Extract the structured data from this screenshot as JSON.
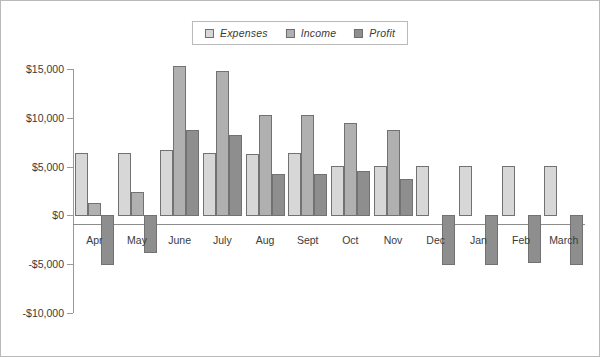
{
  "chart_data": {
    "type": "bar",
    "title": "",
    "xlabel": "",
    "ylabel": "",
    "categories": [
      "Apr",
      "May",
      "June",
      "July",
      "Aug",
      "Sept",
      "Oct",
      "Nov",
      "Dec",
      "Jan",
      "Feb",
      "March"
    ],
    "series": [
      {
        "name": "Expenses",
        "color": "#d7d7d7",
        "values": [
          6350,
          6350,
          6700,
          6350,
          6300,
          6350,
          5100,
          5100,
          5100,
          5100,
          5100,
          5100
        ]
      },
      {
        "name": "Income",
        "color": "#b0b0b0",
        "values": [
          1300,
          2400,
          15350,
          14800,
          10300,
          10300,
          9500,
          8800,
          0,
          0,
          0,
          0
        ]
      },
      {
        "name": "Profit",
        "color": "#8e8e8e",
        "values": [
          -4950,
          -3750,
          8800,
          8200,
          4200,
          4200,
          4500,
          3700,
          -4950,
          -4950,
          -4800,
          -5000
        ]
      }
    ],
    "ylim": [
      -10000,
      15000
    ],
    "yticks": [
      15000,
      10000,
      5000,
      0,
      -5000,
      -10000
    ],
    "ytick_labels": [
      "$15,000",
      "$10,000",
      "$5,000",
      "$0",
      "-$5,000",
      "-$10,000"
    ],
    "grid": false,
    "legend_position": "top-center",
    "legend": [
      "Expenses",
      "Income",
      "Profit"
    ]
  },
  "legend": {
    "items": [
      {
        "label": "Expenses",
        "color": "#d7d7d7"
      },
      {
        "label": "Income",
        "color": "#b0b0b0"
      },
      {
        "label": "Profit",
        "color": "#8e8e8e"
      }
    ]
  },
  "axes": {
    "y_tick_labels": [
      "$15,000",
      "$10,000",
      "$5,000",
      "$0",
      "-$5,000",
      "-$10,000"
    ],
    "x_tick_labels": [
      "Apr",
      "May",
      "June",
      "July",
      "Aug",
      "Sept",
      "Oct",
      "Nov",
      "Dec",
      "Jan",
      "Feb",
      "March"
    ]
  }
}
